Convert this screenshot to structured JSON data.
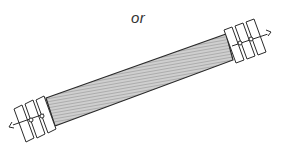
{
  "caption": "or",
  "figure": {
    "colors": {
      "stroke": "#2a2a2a",
      "bar_fill": "#bdbdbd",
      "plate_fill": "#ffffff"
    }
  }
}
